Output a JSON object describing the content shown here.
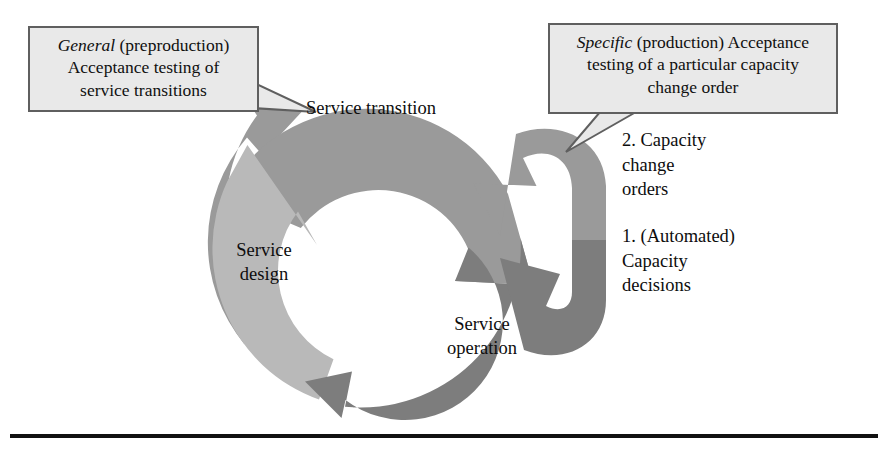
{
  "figure": {
    "type": "cycle-diagram",
    "title_present": false,
    "background_color": "#ffffff",
    "rule_color": "#111111"
  },
  "callouts": [
    {
      "id": "general",
      "emphasis": "General",
      "rest_line1": " (preproduction)",
      "line2": "Acceptance testing of",
      "line3": "service transitions",
      "full_text": "General (preproduction) Acceptance testing of service transitions",
      "points_to": "Service transition",
      "fill": "#e9e9e9",
      "border": "#5f5f5f"
    },
    {
      "id": "specific",
      "emphasis": "Specific",
      "rest_line1": " (production) Acceptance",
      "line2": "testing of a particular capacity",
      "line3": "change order",
      "full_text": "Specific (production) Acceptance testing of a particular capacity change order",
      "points_to": "2. Capacity change orders",
      "fill": "#e9e9e9",
      "border": "#5f5f5f"
    }
  ],
  "ring": {
    "center_x": 375,
    "center_y": 250,
    "outer_radius": 160,
    "inner_radius": 98,
    "segments": [
      {
        "id": "service-transition",
        "label": "Service transition",
        "color": "#9a9a9a",
        "order": 1
      },
      {
        "id": "service-design",
        "label": "Service\ndesign",
        "color": "#b9b9b9",
        "order": 3
      },
      {
        "id": "service-operation",
        "label": "Service\noperation",
        "color": "#7d7d7d",
        "order": 2
      }
    ]
  },
  "inner_loops": [
    {
      "id": "capacity-change-orders-loop",
      "color": "#9a9a9a",
      "note": "2. Capacity\nchange\norders"
    },
    {
      "id": "automated-capacity-decisions-loop",
      "color": "#7d7d7d",
      "note": "1. (Automated)\nCapacity\ndecisions"
    }
  ],
  "side_notes": [
    {
      "id": "capacity-change-orders",
      "text": "2. Capacity\nchange\norders"
    },
    {
      "id": "automated-capacity-decisions",
      "text": "1. (Automated)\nCapacity\ndecisions"
    }
  ]
}
